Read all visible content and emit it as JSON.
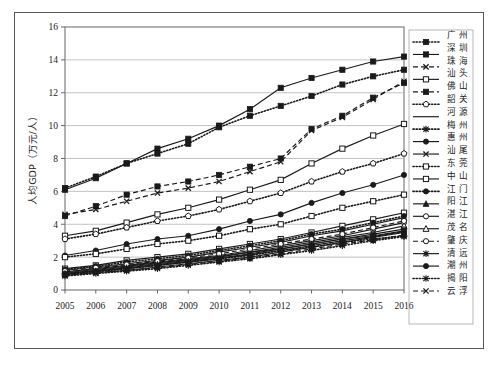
{
  "chart_data": {
    "type": "line",
    "title": "",
    "xlabel": "",
    "ylabel": "人均GDP（万元/人）",
    "x": [
      2005,
      2006,
      2007,
      2008,
      2009,
      2010,
      2011,
      2012,
      2013,
      2014,
      2015,
      2016
    ],
    "xtick_labels": [
      "2005",
      "2006",
      "2007",
      "2008",
      "2009",
      "2010",
      "2011",
      "2012",
      "2013",
      "2014",
      "2015",
      "2016"
    ],
    "ytick_labels": [
      "0",
      "2",
      "4",
      "6",
      "8",
      "10",
      "12",
      "14",
      "16"
    ],
    "yticks": [
      0,
      2,
      4,
      6,
      8,
      10,
      12,
      14,
      16
    ],
    "ylim": [
      0,
      16
    ],
    "grid": "horizontal",
    "legend_position": "right-outside",
    "series": [
      {
        "name": "广州",
        "marker": "filled-square",
        "line": "dotted",
        "values": [
          6.2,
          6.9,
          7.7,
          8.3,
          8.9,
          9.9,
          10.6,
          11.2,
          11.8,
          12.5,
          13.0,
          13.4
        ]
      },
      {
        "name": "深圳",
        "marker": "filled-square",
        "line": "solid",
        "values": [
          6.1,
          6.8,
          7.7,
          8.6,
          9.2,
          10.0,
          11.0,
          12.3,
          12.9,
          13.4,
          13.9,
          14.2
        ]
      },
      {
        "name": "珠海",
        "marker": "x",
        "line": "dashed",
        "values": [
          4.6,
          4.9,
          5.4,
          5.9,
          6.2,
          6.6,
          7.2,
          7.8,
          9.7,
          10.5,
          11.6,
          12.7
        ]
      },
      {
        "name": "汕头",
        "marker": "open-square",
        "line": "solid",
        "values": [
          3.3,
          3.6,
          4.1,
          4.6,
          5.0,
          5.5,
          6.1,
          6.7,
          7.7,
          8.6,
          9.4,
          10.1
        ]
      },
      {
        "name": "佛山",
        "marker": "filled-square",
        "line": "dashed",
        "values": [
          4.5,
          5.1,
          5.8,
          6.3,
          6.6,
          7.0,
          7.5,
          8.0,
          9.8,
          10.6,
          11.7,
          12.6
        ]
      },
      {
        "name": "韶关",
        "marker": "open-pentagon",
        "line": "dotted",
        "values": [
          3.1,
          3.4,
          3.8,
          4.2,
          4.5,
          4.9,
          5.4,
          5.9,
          6.6,
          7.2,
          7.7,
          8.3
        ]
      },
      {
        "name": "河源",
        "marker": "none",
        "line": "solid",
        "values": [
          1.0,
          1.2,
          1.4,
          1.6,
          1.8,
          2.0,
          2.3,
          2.5,
          2.8,
          3.1,
          3.3,
          3.6
        ]
      },
      {
        "name": "梅州",
        "marker": "star",
        "line": "dotted",
        "values": [
          0.95,
          1.1,
          1.3,
          1.5,
          1.7,
          1.9,
          2.1,
          2.4,
          2.6,
          2.9,
          3.1,
          3.3
        ]
      },
      {
        "name": "惠州",
        "marker": "filled-circle",
        "line": "solid",
        "values": [
          2.1,
          2.4,
          2.8,
          3.1,
          3.3,
          3.7,
          4.2,
          4.6,
          5.3,
          5.9,
          6.4,
          7.0
        ]
      },
      {
        "name": "汕尾",
        "marker": "x",
        "line": "solid",
        "values": [
          0.9,
          1.05,
          1.2,
          1.4,
          1.6,
          1.8,
          2.0,
          2.3,
          2.6,
          2.9,
          3.2,
          3.5
        ]
      },
      {
        "name": "东莞",
        "marker": "open-square",
        "line": "dotted",
        "values": [
          2.0,
          2.2,
          2.5,
          2.8,
          3.0,
          3.3,
          3.7,
          4.0,
          4.5,
          5.0,
          5.4,
          5.8
        ]
      },
      {
        "name": "中山",
        "marker": "open-square",
        "line": "solid",
        "values": [
          1.3,
          1.5,
          1.8,
          2.0,
          2.2,
          2.5,
          2.8,
          3.1,
          3.5,
          3.9,
          4.3,
          4.7
        ]
      },
      {
        "name": "江门",
        "marker": "filled-circle",
        "line": "dotted",
        "values": [
          1.25,
          1.45,
          1.7,
          1.9,
          2.1,
          2.4,
          2.7,
          3.0,
          3.4,
          3.7,
          4.1,
          4.5
        ]
      },
      {
        "name": "阳江",
        "marker": "filled-triangle",
        "line": "solid",
        "values": [
          1.2,
          1.4,
          1.6,
          1.8,
          2.0,
          2.3,
          2.6,
          2.9,
          3.3,
          3.6,
          4.0,
          4.4
        ]
      },
      {
        "name": "湛江",
        "marker": "open-circle",
        "line": "solid",
        "values": [
          1.1,
          1.3,
          1.5,
          1.7,
          1.9,
          2.1,
          2.4,
          2.7,
          3.0,
          3.3,
          3.7,
          4.1
        ]
      },
      {
        "name": "茂名",
        "marker": "open-triangle",
        "line": "solid",
        "values": [
          1.05,
          1.25,
          1.45,
          1.65,
          1.85,
          2.05,
          2.3,
          2.6,
          2.9,
          3.2,
          3.5,
          3.9
        ]
      },
      {
        "name": "肇庆",
        "marker": "open-circle",
        "line": "dashed",
        "values": [
          1.15,
          1.35,
          1.55,
          1.75,
          1.95,
          2.2,
          2.5,
          2.8,
          3.1,
          3.4,
          3.8,
          4.2
        ]
      },
      {
        "name": "清远",
        "marker": "star",
        "line": "solid",
        "values": [
          1.0,
          1.15,
          1.35,
          1.55,
          1.75,
          1.95,
          2.2,
          2.5,
          2.8,
          3.1,
          3.4,
          3.7
        ]
      },
      {
        "name": "潮州",
        "marker": "filled-circle",
        "line": "solid",
        "values": [
          0.98,
          1.15,
          1.3,
          1.5,
          1.7,
          1.9,
          2.15,
          2.4,
          2.7,
          3.0,
          3.25,
          3.55
        ]
      },
      {
        "name": "揭阳",
        "marker": "star",
        "line": "dotted",
        "values": [
          0.85,
          1.0,
          1.15,
          1.3,
          1.5,
          1.7,
          1.9,
          2.15,
          2.4,
          2.7,
          3.0,
          3.25
        ]
      },
      {
        "name": "云浮",
        "marker": "x",
        "line": "dashed",
        "values": [
          0.9,
          1.05,
          1.2,
          1.35,
          1.55,
          1.75,
          1.95,
          2.2,
          2.5,
          2.8,
          3.05,
          3.35
        ]
      }
    ]
  },
  "style": {
    "line_color": "#1a1a1a",
    "grid_color": "#b4b4b4",
    "frame_color": "#555555",
    "background": "#ffffff"
  }
}
